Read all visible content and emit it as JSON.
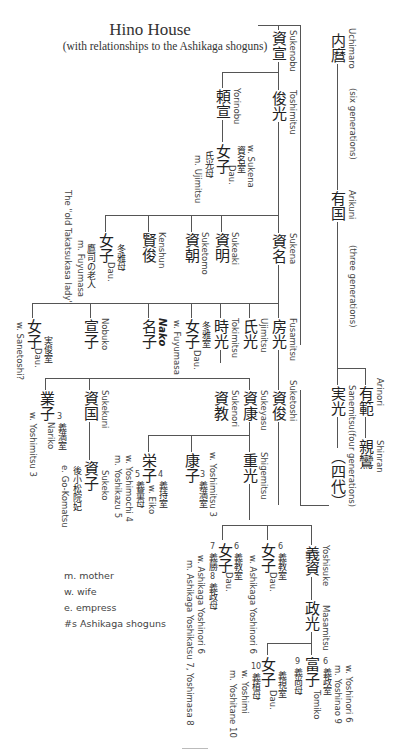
{
  "title": "Hino House",
  "subtitle": "(with relationships to the Ashikaga shoguns)",
  "legend": [
    "m. mother",
    "w. wife",
    "e. empress",
    "#s Ashikaga shoguns"
  ],
  "persons": {
    "sukenobu": {
      "kanji": "資宣",
      "romaji": "Sukenobu"
    },
    "toshimitsu": {
      "kanji": "俊光",
      "romaji": "Toshimitsu"
    },
    "yorinobu": {
      "kanji": "頼宣",
      "romaji": "Yorinobu"
    },
    "yorinobu_dau": {
      "kanji": "女子",
      "note_kanji": "資名室",
      "note2_kanji": "氏光母",
      "romaji": "w. Sukena",
      "romaji2": "Dau.",
      "romaji3": "m. Ujimitsu"
    },
    "uchimaro": {
      "kanji": "内麿",
      "romaji": "Uchimaro"
    },
    "six_gen": "(six generations)",
    "arikuni": {
      "kanji": "有国",
      "romaji": "Arikuni"
    },
    "three_gen": "(three generations)",
    "sukena": {
      "kanji": "資名",
      "romaji": "Sukena"
    },
    "sukeaki": {
      "kanji": "資明",
      "romaji": "Sukeaki"
    },
    "suketomo": {
      "kanji": "資朝",
      "romaji": "Suketomo"
    },
    "kenshun": {
      "kanji": "賢俊",
      "romaji": "Kenshun"
    },
    "sukena_dau": {
      "kanji": "女子",
      "note_kanji": "冬雅母",
      "note2_kanji": "鷹司の老人",
      "romaji": "Dau.",
      "romaji2": "m. Fuyumasa",
      "romaji3": "The \"old Takatsukasa lady\""
    },
    "fusamitsu": {
      "kanji": "房光",
      "romaji": "Fusamitsu"
    },
    "ujimitsu": {
      "kanji": "氏光",
      "romaji": "Ujimitsu"
    },
    "tokimitsu": {
      "kanji": "時光",
      "romaji": "Tokimitsu"
    },
    "tokimitsu_sis": {
      "kanji": "女子",
      "note_kanji": "冬雅室",
      "romaji": "Dau.",
      "romaji2": "w. Fuyumasa"
    },
    "nako": {
      "kanji": "名子",
      "romaji": "Nako"
    },
    "nobuko": {
      "kanji": "宣子",
      "romaji": "Nobuko"
    },
    "sanetoshi_w": {
      "kanji": "女子",
      "note_kanji": "実俊室",
      "romaji": "Dau.",
      "romaji2": "w. Sanetoshi?"
    },
    "suketoshi": {
      "kanji": "資俊",
      "romaji": "Suketoshi"
    },
    "sukeyasu": {
      "kanji": "資康",
      "romaji": "Sukeyasu"
    },
    "sukenori": {
      "kanji": "資教",
      "romaji": "Sukenori"
    },
    "sukekuni": {
      "kanji": "資国",
      "romaji": "Sukekuni"
    },
    "nariko": {
      "kanji": "業子",
      "num": "3",
      "note_kanji": "義満室",
      "romaji": "Nariko",
      "romaji2": "w. Yoshimitsu 3"
    },
    "sukeko": {
      "kanji": "資子",
      "note_kanji": "後小松院妃",
      "romaji": "Sukeko",
      "romaji2": "e. Go-Komatsu"
    },
    "eiko": {
      "kanji": "栄子",
      "num": "4",
      "note_kanji": "義持室",
      "num2": "5",
      "note2_kanji": "義量母",
      "romaji": "w. Eiko",
      "romaji2": "w. Yoshimochi 4",
      "romaji3": "m. Yoshikazu 5"
    },
    "yasuko": {
      "kanji": "康子",
      "num": "3",
      "note_kanji": "義満室",
      "romaji": "w. Yoshimitsu 3"
    },
    "shigemitsu": {
      "kanji": "重光",
      "romaji": "Shigemitsu"
    },
    "arinori": {
      "kanji": "有範",
      "romaji": "Arinori"
    },
    "shinran": {
      "kanji": "親鸞",
      "romaji": "Shinran"
    },
    "sanemitsu": {
      "kanji": "実光",
      "romaji": "Sanemitsu"
    },
    "four_gen_kanji": "（四代）",
    "four_gen": "(four generations)",
    "yoshisuke": {
      "kanji": "義資",
      "romaji": "Yoshisuke"
    },
    "masamitsu": {
      "kanji": "政光",
      "romaji": "Masamitsu"
    },
    "dau_yoshinori": {
      "kanji": "女子",
      "num": "6",
      "note_kanji": "義教室",
      "romaji": "Dau.",
      "romaji2": "w. Ashikaga Yoshinori 6"
    },
    "dau_yoshikatsu": {
      "kanji": "女子",
      "num": "6",
      "note_kanji": "義教室",
      "num2": "7",
      "note2_kanji": "義勝",
      "num3": "8",
      "note3_kanji": "義政母",
      "romaji": "Dau.",
      "romaji2": "w. Ashikaga Yoshinori 6",
      "romaji3": "m. Ashikaga Yoshikatsu 7, Yoshimasa 8"
    },
    "tomiko": {
      "kanji": "富子",
      "num": "6",
      "note_kanji": "義政室",
      "num2": "9",
      "note2_kanji": "義尚母",
      "romaji": "Tomiko",
      "romaji2": "w. Yoshinori 6",
      "romaji3": "m. Yoshinao 9"
    },
    "dau_yoshimi": {
      "kanji": "女子",
      "note_kanji": "義視室",
      "num2": "10",
      "note2_kanji": "義植母",
      "romaji": "Dau.",
      "romaji2": "w. Yoshimi",
      "romaji3": "m. Yoshitane 10"
    }
  }
}
